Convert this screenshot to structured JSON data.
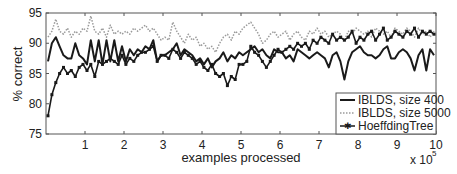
{
  "chart_data": {
    "type": "line",
    "title": "",
    "xlabel": "examples processed",
    "ylabel": "% correct",
    "x_multiplier_label": "x 10",
    "x_multiplier_exponent": "5",
    "xlim": [
      0,
      10
    ],
    "ylim": [
      75,
      95
    ],
    "x_ticks": [
      "1",
      "2",
      "3",
      "4",
      "5",
      "6",
      "7",
      "8",
      "9",
      "10"
    ],
    "y_ticks": [
      "75",
      "80",
      "85",
      "90",
      "95"
    ],
    "grid": false,
    "legend_position": "lower right",
    "x": [
      0.05,
      0.15,
      0.25,
      0.35,
      0.45,
      0.55,
      0.65,
      0.75,
      0.85,
      0.95,
      1.05,
      1.15,
      1.25,
      1.35,
      1.45,
      1.55,
      1.65,
      1.75,
      1.85,
      1.95,
      2.05,
      2.15,
      2.25,
      2.35,
      2.45,
      2.55,
      2.65,
      2.75,
      2.85,
      2.95,
      3.05,
      3.15,
      3.25,
      3.35,
      3.45,
      3.55,
      3.65,
      3.75,
      3.85,
      3.95,
      4.05,
      4.15,
      4.25,
      4.35,
      4.45,
      4.55,
      4.65,
      4.75,
      4.85,
      4.95,
      5.05,
      5.15,
      5.25,
      5.35,
      5.45,
      5.55,
      5.65,
      5.75,
      5.85,
      5.95,
      6.05,
      6.15,
      6.25,
      6.35,
      6.45,
      6.55,
      6.65,
      6.75,
      6.85,
      6.95,
      7.05,
      7.15,
      7.25,
      7.35,
      7.45,
      7.55,
      7.65,
      7.75,
      7.85,
      7.95,
      8.05,
      8.15,
      8.25,
      8.35,
      8.45,
      8.55,
      8.65,
      8.75,
      8.85,
      8.95,
      9.05,
      9.15,
      9.25,
      9.35,
      9.45,
      9.55,
      9.65,
      9.75,
      9.85,
      9.95
    ],
    "series": [
      {
        "name": "IBLDS, size 400",
        "style": "solid",
        "color": "#1a1a1a",
        "values": [
          87.0,
          90.0,
          91.0,
          89.5,
          88.0,
          87.5,
          87.5,
          90.0,
          88.0,
          87.5,
          86.5,
          90.5,
          87.0,
          90.5,
          86.5,
          90.5,
          87.0,
          90.5,
          87.0,
          89.5,
          87.0,
          89.0,
          88.0,
          89.0,
          88.5,
          89.5,
          89.0,
          90.5,
          87.0,
          88.0,
          88.0,
          88.5,
          89.0,
          90.0,
          88.0,
          89.0,
          88.5,
          88.0,
          87.0,
          87.5,
          86.5,
          87.5,
          86.0,
          87.0,
          87.5,
          88.5,
          87.0,
          88.0,
          87.5,
          88.5,
          88.0,
          88.5,
          89.0,
          89.5,
          88.5,
          89.0,
          88.0,
          87.5,
          89.0,
          88.5,
          88.5,
          87.5,
          88.0,
          87.0,
          89.0,
          88.5,
          88.0,
          87.5,
          88.0,
          88.5,
          88.0,
          87.5,
          86.0,
          88.0,
          88.5,
          87.0,
          84.0,
          87.0,
          88.5,
          89.0,
          89.5,
          88.5,
          88.0,
          88.0,
          87.5,
          88.0,
          89.0,
          89.5,
          87.5,
          87.5,
          88.5,
          89.0,
          88.5,
          87.5,
          85.5,
          88.0,
          89.0,
          85.5,
          89.0,
          88.0
        ]
      },
      {
        "name": "IBLDS, size 5000",
        "style": "dotted",
        "color": "#9a9a9a",
        "values": [
          91.0,
          92.0,
          94.0,
          92.0,
          91.5,
          92.5,
          91.0,
          92.0,
          91.5,
          92.5,
          92.0,
          94.5,
          92.0,
          91.5,
          92.5,
          91.0,
          93.0,
          91.5,
          92.0,
          91.5,
          92.0,
          91.5,
          92.5,
          92.0,
          92.5,
          93.0,
          92.0,
          92.5,
          91.5,
          90.5,
          91.0,
          90.5,
          93.5,
          92.0,
          91.0,
          90.0,
          91.5,
          90.5,
          91.0,
          89.5,
          90.0,
          89.0,
          89.5,
          88.5,
          90.0,
          91.0,
          91.5,
          90.5,
          92.0,
          91.5,
          92.5,
          93.0,
          93.5,
          92.5,
          91.5,
          90.0,
          90.5,
          91.5,
          92.0,
          91.0,
          91.5,
          92.0,
          90.5,
          91.5,
          92.0,
          91.0,
          90.5,
          92.0,
          91.5,
          92.5,
          91.5,
          92.0,
          91.0,
          91.5,
          92.0,
          91.5,
          90.5,
          92.0,
          91.5,
          92.5,
          92.0,
          91.5,
          92.0,
          91.0,
          92.5,
          92.0,
          91.5,
          92.0,
          91.0,
          92.5,
          92.0,
          91.5,
          92.5,
          92.0,
          91.0,
          92.5,
          91.5,
          92.0,
          91.0,
          92.0
        ]
      },
      {
        "name": "HoeffdingTree",
        "style": "solid-star-markers",
        "color": "#1a1a1a",
        "values": [
          78.0,
          81.5,
          83.5,
          85.0,
          86.0,
          85.0,
          85.5,
          84.5,
          86.0,
          86.5,
          85.5,
          86.5,
          84.5,
          87.0,
          86.5,
          87.0,
          87.5,
          87.0,
          86.5,
          88.0,
          86.5,
          87.5,
          87.0,
          88.0,
          88.5,
          88.5,
          89.0,
          89.5,
          87.0,
          88.0,
          88.0,
          87.5,
          89.0,
          88.5,
          87.5,
          88.5,
          88.0,
          87.5,
          86.5,
          87.0,
          86.0,
          85.5,
          86.5,
          85.0,
          84.5,
          85.0,
          83.0,
          84.5,
          84.0,
          86.5,
          86.5,
          87.0,
          89.5,
          88.5,
          88.0,
          87.0,
          86.0,
          87.0,
          88.0,
          89.0,
          88.5,
          89.0,
          89.5,
          89.0,
          90.0,
          89.5,
          90.0,
          89.0,
          90.5,
          90.0,
          91.0,
          90.5,
          90.0,
          91.5,
          90.5,
          91.0,
          90.5,
          91.0,
          92.0,
          90.0,
          91.0,
          90.5,
          91.5,
          92.0,
          90.5,
          91.5,
          92.5,
          90.5,
          91.0,
          92.0,
          91.5,
          91.0,
          92.0,
          91.5,
          92.5,
          91.0,
          92.0,
          91.5,
          92.0,
          91.5
        ]
      }
    ]
  },
  "legend": {
    "items": [
      {
        "label": "IBLDS, size 400"
      },
      {
        "label": "IBLDS, size 5000"
      },
      {
        "label": "HoeffdingTree"
      }
    ]
  }
}
